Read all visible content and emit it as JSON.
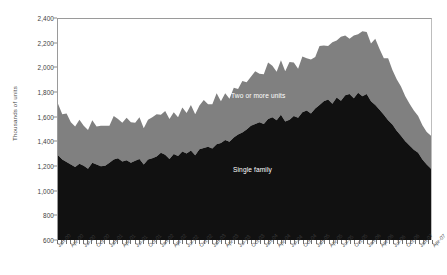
{
  "chart_data": {
    "type": "area",
    "stacked": true,
    "title": "",
    "xlabel": "",
    "ylabel": "Thousands of units",
    "ylim": [
      600,
      2400
    ],
    "ytick_step": 200,
    "ytick_labels": [
      "600",
      "800",
      "1,000",
      "1,200",
      "1,400",
      "1,600",
      "1,800",
      "2,000",
      "2,200",
      "2,400"
    ],
    "grid": false,
    "legend_position": "inline-annotations",
    "annotations": [
      {
        "text": "Two or more units",
        "series": "Two or more units"
      },
      {
        "text": "Single family",
        "series": "Single family"
      }
    ],
    "x": [
      "Jan-00",
      "Feb-00",
      "Mar-00",
      "Apr-00",
      "May-00",
      "Jun-00",
      "Jul-00",
      "Aug-00",
      "Sep-00",
      "Oct-00",
      "Nov-00",
      "Dec-00",
      "Jan-01",
      "Feb-01",
      "Mar-01",
      "Apr-01",
      "May-01",
      "Jun-01",
      "Jul-01",
      "Aug-01",
      "Sep-01",
      "Oct-01",
      "Nov-01",
      "Dec-01",
      "Jan-02",
      "Feb-02",
      "Mar-02",
      "Apr-02",
      "May-02",
      "Jun-02",
      "Jul-02",
      "Aug-02",
      "Sep-02",
      "Oct-02",
      "Nov-02",
      "Dec-02",
      "Jan-03",
      "Feb-03",
      "Mar-03",
      "Apr-03",
      "May-03",
      "Jun-03",
      "Jul-03",
      "Aug-03",
      "Sep-03",
      "Oct-03",
      "Nov-03",
      "Dec-03",
      "Jan-04",
      "Feb-04",
      "Mar-04",
      "Apr-04",
      "May-04",
      "Jun-04",
      "Jul-04",
      "Aug-04",
      "Sep-04",
      "Oct-04",
      "Nov-04",
      "Dec-04",
      "Jan-05",
      "Feb-05",
      "Mar-05",
      "Apr-05",
      "May-05",
      "Jun-05",
      "Jul-05",
      "Aug-05",
      "Sep-05",
      "Oct-05",
      "Nov-05",
      "Dec-05",
      "Jan-06",
      "Feb-06",
      "Mar-06",
      "Apr-06",
      "May-06",
      "Jun-06",
      "Jul-06",
      "Aug-06",
      "Sep-06",
      "Oct-06",
      "Nov-06",
      "Dec-06",
      "Jan-07",
      "Feb-07",
      "Mar-07",
      "Apr-07"
    ],
    "xtick_labels": [
      "Jan-00",
      "Apr-00",
      "Jul-00",
      "Oct-00",
      "Jan-01",
      "Apr-01",
      "Jul-01",
      "Oct-01",
      "Jan-02",
      "Apr-02",
      "Jul-02",
      "Oct-02",
      "Jan-03",
      "Apr-03",
      "Jul-03",
      "Oct-03",
      "Jan-04",
      "Apr-04",
      "Jul-04",
      "Oct-04",
      "Jan-05",
      "Apr-05",
      "Jul-05",
      "Oct-05",
      "Jan-06",
      "Apr-06",
      "Jul-06",
      "Oct-06",
      "Jan-07",
      "Apr-07"
    ],
    "series": [
      {
        "name": "Single family",
        "color": "#111111",
        "values": [
          1290,
          1255,
          1235,
          1215,
          1195,
          1220,
          1205,
          1180,
          1230,
          1215,
          1200,
          1205,
          1230,
          1255,
          1265,
          1240,
          1250,
          1230,
          1245,
          1260,
          1215,
          1255,
          1265,
          1280,
          1310,
          1295,
          1260,
          1300,
          1285,
          1320,
          1305,
          1330,
          1290,
          1340,
          1350,
          1360,
          1345,
          1380,
          1390,
          1415,
          1400,
          1435,
          1460,
          1475,
          1500,
          1530,
          1545,
          1560,
          1545,
          1585,
          1600,
          1575,
          1620,
          1565,
          1580,
          1610,
          1595,
          1640,
          1655,
          1630,
          1670,
          1700,
          1730,
          1745,
          1710,
          1760,
          1735,
          1780,
          1790,
          1755,
          1800,
          1770,
          1790,
          1730,
          1700,
          1660,
          1620,
          1575,
          1540,
          1490,
          1450,
          1405,
          1370,
          1335,
          1310,
          1255,
          1215,
          1180
        ]
      },
      {
        "name": "Two or more units",
        "color": "#808080",
        "values": [
          420,
          370,
          395,
          345,
          330,
          360,
          325,
          315,
          345,
          310,
          330,
          325,
          300,
          355,
          320,
          315,
          345,
          330,
          310,
          340,
          295,
          325,
          335,
          345,
          310,
          355,
          325,
          340,
          315,
          360,
          330,
          370,
          335,
          355,
          390,
          345,
          360,
          415,
          340,
          380,
          350,
          405,
          370,
          420,
          385,
          400,
          430,
          395,
          405,
          460,
          420,
          395,
          445,
          410,
          470,
          435,
          400,
          455,
          425,
          440,
          420,
          480,
          455,
          435,
          500,
          465,
          520,
          485,
          450,
          510,
          475,
          530,
          505,
          470,
          540,
          495,
          460,
          505,
          445,
          420,
          400,
          365,
          340,
          320,
          300,
          280,
          265,
          270
        ]
      }
    ]
  }
}
